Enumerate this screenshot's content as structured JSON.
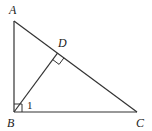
{
  "diagram": {
    "type": "geometry",
    "points": {
      "A": {
        "label": "A",
        "x": 14,
        "y": 21
      },
      "B": {
        "label": "B",
        "x": 14,
        "y": 112
      },
      "C": {
        "label": "C",
        "x": 137,
        "y": 112
      },
      "D": {
        "label": "D",
        "x": 57.5,
        "y": 53.2
      }
    },
    "segments": [
      "AB",
      "BC",
      "AC",
      "BD"
    ],
    "right_angles": [
      "B",
      "D"
    ],
    "angle_labels": [
      {
        "label": "1",
        "at": "B",
        "between": [
          "BD",
          "BC"
        ]
      }
    ]
  }
}
